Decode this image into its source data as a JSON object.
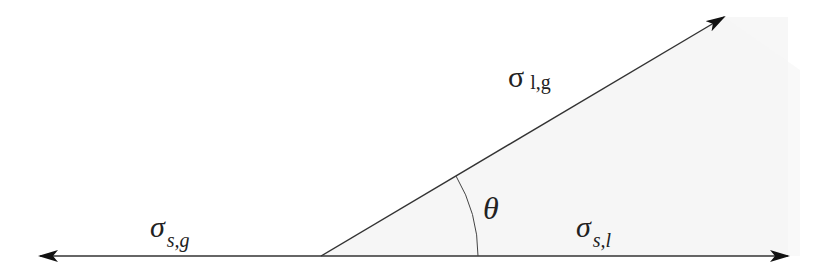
{
  "diagram": {
    "colors": {
      "line": "#333333",
      "arrowhead": "#111111",
      "wedge_fill": "#f6f6f6",
      "background": "#ffffff"
    },
    "geometry": {
      "vertex": [
        321,
        256
      ],
      "left_tip": [
        40,
        256
      ],
      "right_tip": [
        788,
        256
      ],
      "upper_tip": [
        724,
        17
      ],
      "arc_radius": 157
    },
    "labels": {
      "sigma_lg": {
        "symbol": "σ",
        "subscript": "l,g"
      },
      "sigma_sg": {
        "symbol": "σ",
        "subscript": "s,g"
      },
      "sigma_sl": {
        "symbol": "σ",
        "subscript": "s,l"
      },
      "theta": {
        "symbol": "θ"
      }
    }
  }
}
